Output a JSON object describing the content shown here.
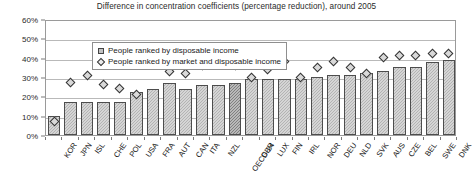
{
  "chart_data": {
    "type": "bar",
    "title": "Difference in concentration coefficients (percentage reduction), around 2005",
    "xlabel": "",
    "ylabel": "",
    "ylim": [
      0,
      60
    ],
    "yticks": [
      0,
      10,
      20,
      30,
      40,
      50,
      60
    ],
    "ytick_labels": [
      "0%",
      "10%",
      "20%",
      "30%",
      "40%",
      "50%",
      "60%"
    ],
    "grid": true,
    "legend_position": "top-left-inside",
    "highlight_category": "OECD-24",
    "categories": [
      "KOR",
      "JPN",
      "ISL",
      "CHE",
      "POL",
      "USA",
      "FRA",
      "AUT",
      "CAN",
      "ITA",
      "NZL",
      "OECD-24",
      "GBR",
      "LUX",
      "FIN",
      "IRL",
      "NOR",
      "DEU",
      "NLD",
      "SVK",
      "AUS",
      "CZE",
      "BEL",
      "SWE",
      "DNK"
    ],
    "series": [
      {
        "name": "People ranked by disposable income",
        "type": "bar",
        "values": [
          10,
          17,
          17,
          17,
          17,
          22,
          24,
          27,
          24,
          26,
          26,
          27,
          29,
          29,
          29,
          29,
          30,
          31,
          31,
          32,
          33,
          35,
          35,
          38,
          39
        ]
      },
      {
        "name": "People ranked by market and disposable income",
        "type": "marker",
        "values": [
          8,
          28,
          32,
          27,
          25,
          22,
          40,
          34,
          33,
          37,
          42,
          37,
          31,
          35,
          39,
          31,
          36,
          39,
          36,
          33,
          41,
          42,
          42,
          43,
          43
        ]
      }
    ]
  },
  "legend": {
    "items": [
      {
        "label": "People ranked by disposable income",
        "marker": "bar-swatch"
      },
      {
        "label": "People ranked by market and disposable income",
        "marker": "diamond-swatch"
      }
    ]
  },
  "colors": {
    "bar_fill": "#b3b3b3",
    "bar_highlight": "#808080",
    "bar_stroke": "#4d4d4d",
    "marker_fill": "#d9d9d9",
    "marker_stroke": "#333333",
    "gridline": "#b9b9b9",
    "frame": "#9a9a9a",
    "background": "#ffffff"
  }
}
